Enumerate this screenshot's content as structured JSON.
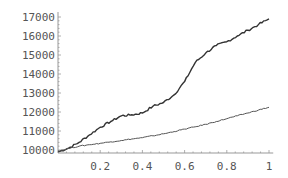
{
  "chart_data": {
    "type": "line",
    "title": "",
    "xlabel": "",
    "ylabel": "",
    "xlim": [
      0,
      1
    ],
    "ylim": [
      10000,
      17000
    ],
    "grid": false,
    "legend": null,
    "x_ticks": [
      {
        "value": 0.2,
        "label": "0.2"
      },
      {
        "value": 0.4,
        "label": "0.4"
      },
      {
        "value": 0.6,
        "label": "0.6"
      },
      {
        "value": 0.8,
        "label": "0.8"
      },
      {
        "value": 1.0,
        "label": "1"
      }
    ],
    "y_ticks": [
      {
        "value": 10000,
        "label": "10000"
      },
      {
        "value": 11000,
        "label": "11000"
      },
      {
        "value": 12000,
        "label": "12000"
      },
      {
        "value": 13000,
        "label": "13000"
      },
      {
        "value": 14000,
        "label": "14000"
      },
      {
        "value": 15000,
        "label": "15000"
      },
      {
        "value": 16000,
        "label": "16000"
      },
      {
        "value": 17000,
        "label": "17000"
      }
    ],
    "x": [
      0,
      0.05,
      0.1,
      0.15,
      0.2,
      0.25,
      0.3,
      0.35,
      0.4,
      0.45,
      0.5,
      0.55,
      0.6,
      0.65,
      0.7,
      0.75,
      0.8,
      0.85,
      0.9,
      0.95,
      1.0
    ],
    "series": [
      {
        "name": "upper",
        "color": "#333333",
        "width": 1.4,
        "values": [
          9900,
          10100,
          10400,
          10800,
          11200,
          11500,
          11800,
          11850,
          11950,
          12300,
          12500,
          12900,
          13600,
          14600,
          15100,
          15500,
          15700,
          16000,
          16300,
          16600,
          16900
        ]
      },
      {
        "name": "lower",
        "color": "#555555",
        "width": 1.0,
        "values": [
          9950,
          10080,
          10200,
          10280,
          10350,
          10430,
          10500,
          10580,
          10650,
          10750,
          10850,
          10970,
          11100,
          11220,
          11350,
          11500,
          11650,
          11800,
          11950,
          12100,
          12250
        ]
      }
    ]
  }
}
